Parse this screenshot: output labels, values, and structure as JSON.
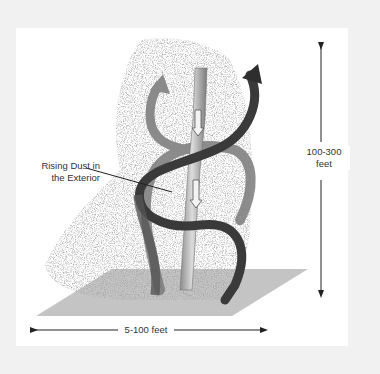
{
  "diagram": {
    "labels": {
      "rising_dust_line1": "Rising Dust in",
      "rising_dust_line2": "the Exterior",
      "height_line1": "100-300",
      "height_line2": "feet",
      "width": "5-100 feet"
    },
    "colors": {
      "page_background": "#f1f1f1",
      "frame_background": "#ffffff",
      "ground_plane": "#bdbdbd",
      "dust": "#6e6e6e",
      "spiral_dark": "#3a3a3a",
      "spiral_light": "#7a7a7a",
      "core_column": "#a8a8a8",
      "text": "#333333"
    }
  }
}
